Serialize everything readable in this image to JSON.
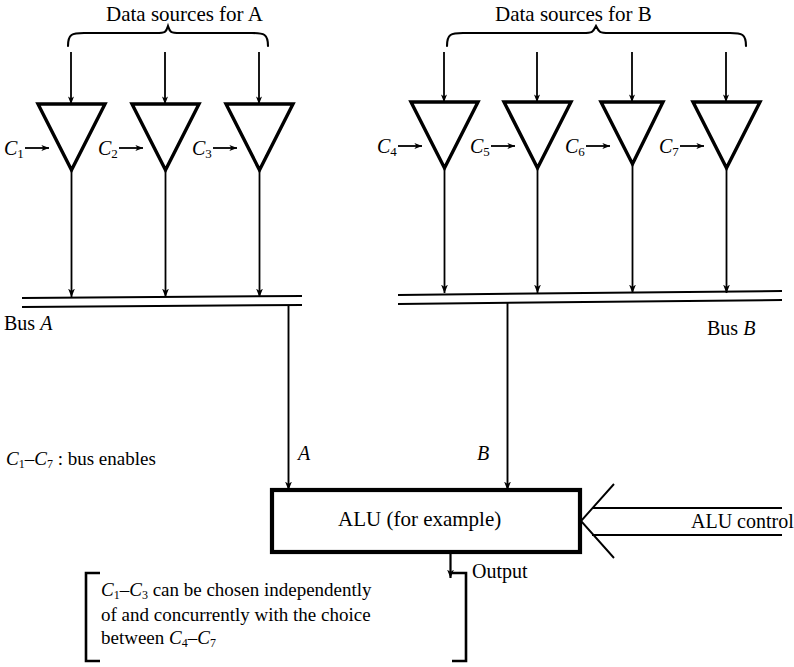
{
  "figure": {
    "type": "block-diagram"
  },
  "groups": [
    {
      "id": "group-a",
      "title": "Data sources for A",
      "brace_x1": 68,
      "brace_x2": 268
    },
    {
      "id": "group-b",
      "title": "Data sources for B",
      "brace_x1": 447,
      "brace_x2": 746
    }
  ],
  "buffers": [
    {
      "label": "C",
      "sub": "1",
      "cx": 71,
      "group": "A"
    },
    {
      "label": "C",
      "sub": "2",
      "cx": 165,
      "group": "A"
    },
    {
      "label": "C",
      "sub": "3",
      "cx": 259,
      "group": "A"
    },
    {
      "label": "C",
      "sub": "4",
      "cx": 444,
      "group": "B"
    },
    {
      "label": "C",
      "sub": "5",
      "cx": 537,
      "group": "B"
    },
    {
      "label": "C",
      "sub": "6",
      "cx": 632,
      "group": "B"
    },
    {
      "label": "C",
      "sub": "7",
      "cx": 726,
      "group": "B"
    }
  ],
  "buses": {
    "a": {
      "label_prefix": "Bus ",
      "label_name": "A",
      "x1": 22,
      "x2": 302,
      "y": 297
    },
    "b": {
      "label_prefix": "Bus ",
      "label_name": "B",
      "x1": 398,
      "x2": 782,
      "y": 293
    }
  },
  "signals": {
    "a": "A",
    "b": "B"
  },
  "alu": {
    "label": "ALU (for example)",
    "control_label": "ALU control",
    "output_label": "Output"
  },
  "legend": {
    "prefix": "C",
    "sub_from": "1",
    "dash": "–",
    "sub_to": "7",
    "text": " : bus enables"
  },
  "note": {
    "line1_a": "C",
    "line1_a_sub": "1",
    "line1_dash": "–",
    "line1_b": "C",
    "line1_b_sub": "3",
    "line1_rest": " can be chosen independently",
    "line2": "of and concurrently with the choice",
    "line3_pre": "between ",
    "line3_a": "C",
    "line3_a_sub": "4",
    "line3_dash": "–",
    "line3_b": "C",
    "line3_b_sub": "7"
  },
  "colors": {
    "ink": "#000000",
    "background": "#ffffff"
  }
}
